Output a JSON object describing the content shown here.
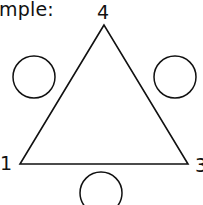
{
  "heading": "mple:",
  "diagram": {
    "shape": "triangle",
    "vertex_labels": {
      "top": "4",
      "bottom_left": "1",
      "bottom_right": "3"
    },
    "circles": [
      {
        "position": "left-side",
        "value": ""
      },
      {
        "position": "right-side",
        "value": ""
      },
      {
        "position": "bottom-side",
        "value": ""
      }
    ],
    "stroke_color": "#111111"
  }
}
